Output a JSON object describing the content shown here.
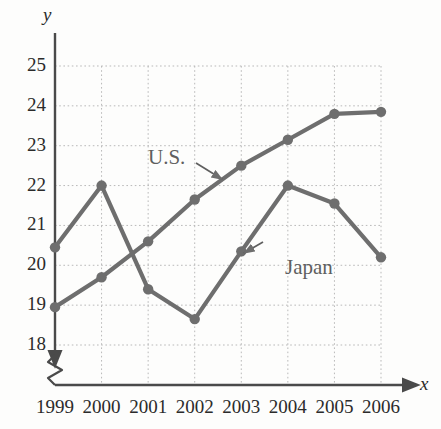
{
  "chart_data": {
    "type": "line",
    "title": "",
    "xlabel": "x",
    "ylabel": "y",
    "grid": true,
    "legend_position": "inline-annotations",
    "axis_break_y": true,
    "x": [
      1999,
      2000,
      2001,
      2002,
      2003,
      2004,
      2005,
      2006
    ],
    "categories": [
      "1999",
      "2000",
      "2001",
      "2002",
      "2003",
      "2004",
      "2005",
      "2006"
    ],
    "xlim": [
      1999,
      2006
    ],
    "ylim": [
      17.6,
      25.3
    ],
    "yticks": [
      18,
      19,
      20,
      21,
      22,
      23,
      24,
      25
    ],
    "ytick_labels": [
      "18",
      "19",
      "20",
      "21",
      "22",
      "23",
      "24",
      "25"
    ],
    "series": [
      {
        "name": "U.S.",
        "color": "#6e6e6e",
        "values": [
          18.95,
          19.7,
          20.6,
          21.65,
          22.5,
          23.15,
          23.8,
          23.85
        ]
      },
      {
        "name": "Japan",
        "color": "#6e6e6e",
        "values": [
          20.45,
          22.0,
          19.4,
          18.65,
          20.35,
          22.0,
          21.55,
          20.2
        ]
      }
    ],
    "annotations": [
      {
        "text": "U.S.",
        "points_to_series": "U.S.",
        "points_to_x": 2002.6,
        "points_to_y": 22.15
      },
      {
        "text": "Japan",
        "points_to_series": "Japan",
        "points_to_x": 2003.05,
        "points_to_y": 20.3
      }
    ]
  },
  "style": {
    "line_color": "#6e6e6e",
    "marker_color": "#6e6e6e",
    "axis_color": "#4a4a4a",
    "grid_color": "#b9b9b9",
    "text_color": "#2b2b2b",
    "label_color": "#5f5f5f",
    "background": "#fdfdfc"
  }
}
